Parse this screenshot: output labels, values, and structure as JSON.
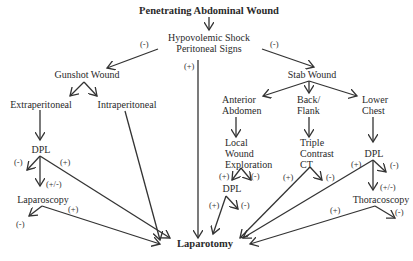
{
  "title": "Penetrating Abdominal Wound",
  "nodes": {
    "hypovolemic": [
      "Hypovolemic Shock",
      "Peritoneal Signs"
    ],
    "gunshot": "Gunshot Wound",
    "stab": "Stab Wound",
    "extraperitoneal": "Extraperitoneal",
    "intraperitoneal": "Intraperitoneal",
    "gsw_dpl": "DPL",
    "laparoscopy": "Laparoscopy",
    "anterior_abdomen": [
      "Anterior",
      "Abdomen"
    ],
    "back_flank": [
      "Back/",
      "Flank"
    ],
    "lower_chest": [
      "Lower",
      "Chest"
    ],
    "local_wound_exploration": [
      "Local",
      "Wound",
      "Exploration"
    ],
    "ant_dpl": "DPL",
    "triple_contrast_ct": [
      "Triple",
      "Contrast",
      "CT"
    ],
    "chest_dpl": "DPL",
    "thoracoscopy": "Thoracoscopy",
    "laparotomy": "Laparotomy"
  },
  "signs": {
    "shock_to_gunshot": "(-)",
    "shock_to_stab": "(-)",
    "shock_to_laparotomy": "(+)",
    "gsw_dpl_neg": "(-)",
    "gsw_dpl_pos": "(+)",
    "gsw_dpl_equivocal": "(+/-)",
    "laparoscopy_pos": "(+)",
    "laparoscopy_neg": "(-)",
    "lwe_pos": "(+)",
    "lwe_neg": "(-)",
    "ant_dpl_pos": "(+)",
    "ant_dpl_neg": "(-)",
    "ct_pos": "(+)",
    "ct_neg": "(-)",
    "chest_dpl_pos": "(+)",
    "chest_dpl_neg": "(-)",
    "chest_dpl_equivocal": "(+/-)",
    "thoracoscopy_pos": "(+)",
    "thoracoscopy_neg": "(-)"
  }
}
